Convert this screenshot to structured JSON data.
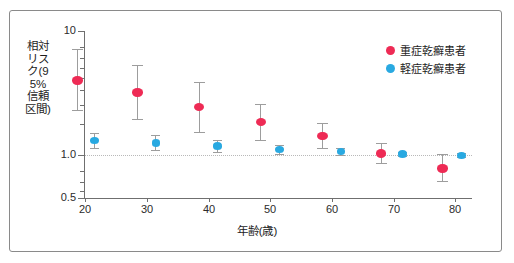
{
  "chart_data": {
    "type": "scatter",
    "title": "",
    "xlabel": "年齢(歳)",
    "ylabel": "相対リスク(95%信頼区間)",
    "xlim": [
      15,
      85
    ],
    "ylim": [
      0.5,
      10
    ],
    "yscale": "log",
    "grid": "horizontal dotted reference line at 1.0",
    "reference_line": 1.0,
    "legend_position": "top-right",
    "xticks": [
      "20",
      "30",
      "40",
      "50",
      "60",
      "70",
      "80"
    ],
    "xtick_values": [
      20,
      30,
      40,
      50,
      60,
      70,
      80
    ],
    "yticks": [
      "10",
      "1.0",
      "0.5"
    ],
    "ytick_values": [
      10,
      1.0,
      0.5
    ],
    "series": [
      {
        "name": "重症乾癬患者",
        "color": "#ee2b55",
        "x": [
          18.8,
          28.5,
          38.5,
          48.5,
          58.5,
          68.0,
          78.0
        ],
        "values": [
          4.0,
          3.2,
          2.45,
          1.85,
          1.42,
          1.03,
          0.78
        ],
        "ci_low": [
          2.3,
          1.95,
          1.53,
          1.33,
          1.13,
          0.86,
          0.62
        ],
        "ci_high": [
          7.1,
          5.3,
          3.9,
          2.6,
          1.82,
          1.25,
          1.02
        ]
      },
      {
        "name": "軽症乾癬患者",
        "color": "#29a9e1",
        "x": [
          21.5,
          31.5,
          41.5,
          51.5,
          61.5,
          71.5,
          81.0
        ],
        "values": [
          1.3,
          1.25,
          1.18,
          1.11,
          1.06,
          1.02,
          0.99
        ],
        "ci_low": [
          1.13,
          1.09,
          1.05,
          1.02,
          1.0,
          0.99,
          0.96
        ],
        "ci_high": [
          1.5,
          1.44,
          1.33,
          1.21,
          1.13,
          1.06,
          1.03
        ]
      }
    ]
  },
  "legend": {
    "items": [
      {
        "label": "重症乾癬患者",
        "color": "#ee2b55"
      },
      {
        "label": "軽症乾癬患者",
        "color": "#29a9e1"
      }
    ]
  },
  "axes": {
    "y_title": "相対リスク(95%信頼区間)",
    "x_title": "年齢(歳)"
  }
}
